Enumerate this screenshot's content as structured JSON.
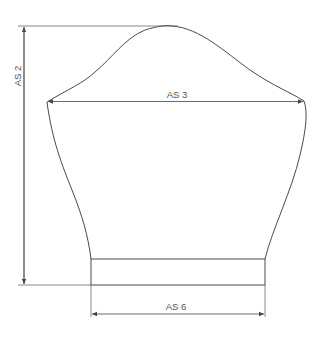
{
  "diagram": {
    "type": "sleeve-pattern",
    "dimensions": [
      {
        "id": "as2",
        "label": "AS 2",
        "orientation": "vertical",
        "description": "sleeve length"
      },
      {
        "id": "as3",
        "label": "AS 3",
        "orientation": "horizontal",
        "description": "sleeve width at armpit"
      },
      {
        "id": "as6",
        "label": "AS 6",
        "orientation": "horizontal",
        "description": "cuff width"
      }
    ],
    "colors": {
      "outline": "#4a4a4a",
      "guide": "#7a7a7a",
      "label": "#555555",
      "background": "#ffffff"
    }
  }
}
